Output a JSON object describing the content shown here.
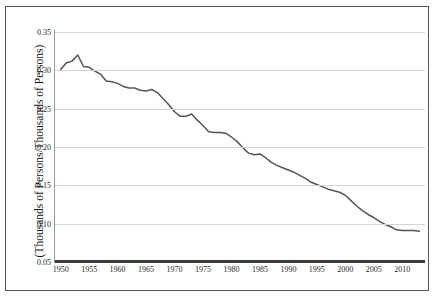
{
  "figure": {
    "clipped_header_text": "",
    "background_color": "#ffffff",
    "border_color": "#555555"
  },
  "axis": {
    "y_title": "(Thousands of Persons/Thousands of Persons)",
    "y_ticks": [
      "0.35",
      "0.30",
      "0.25",
      "0.20",
      "0.15",
      "0.10",
      "0.05"
    ],
    "x_ticks": [
      "1950",
      "1955",
      "1960",
      "1965",
      "1970",
      "1975",
      "1980",
      "1985",
      "1990",
      "1995",
      "2000",
      "2005",
      "2010"
    ]
  },
  "chart_data": {
    "type": "line",
    "title": "",
    "xlabel": "",
    "ylabel": "(Thousands of Persons/Thousands of Persons)",
    "xlim": [
      1949,
      2014
    ],
    "ylim": [
      0.05,
      0.35
    ],
    "grid": true,
    "legend": "none",
    "line_color": "#555555",
    "x": [
      1950,
      1951,
      1952,
      1953,
      1954,
      1955,
      1956,
      1957,
      1958,
      1959,
      1960,
      1961,
      1962,
      1963,
      1964,
      1965,
      1966,
      1967,
      1968,
      1969,
      1970,
      1971,
      1972,
      1973,
      1974,
      1975,
      1976,
      1977,
      1978,
      1979,
      1980,
      1981,
      1982,
      1983,
      1984,
      1985,
      1986,
      1987,
      1988,
      1989,
      1990,
      1991,
      1992,
      1993,
      1994,
      1995,
      1996,
      1997,
      1998,
      1999,
      2000,
      2001,
      2002,
      2003,
      2004,
      2005,
      2006,
      2007,
      2008,
      2009,
      2010,
      2011,
      2012,
      2013
    ],
    "values": [
      0.301,
      0.31,
      0.312,
      0.32,
      0.305,
      0.304,
      0.299,
      0.295,
      0.286,
      0.285,
      0.283,
      0.279,
      0.277,
      0.277,
      0.274,
      0.273,
      0.275,
      0.271,
      0.263,
      0.255,
      0.246,
      0.24,
      0.24,
      0.243,
      0.235,
      0.228,
      0.22,
      0.219,
      0.219,
      0.218,
      0.213,
      0.207,
      0.199,
      0.192,
      0.19,
      0.191,
      0.186,
      0.18,
      0.176,
      0.173,
      0.17,
      0.167,
      0.163,
      0.159,
      0.154,
      0.151,
      0.148,
      0.145,
      0.143,
      0.141,
      0.137,
      0.13,
      0.123,
      0.117,
      0.112,
      0.108,
      0.103,
      0.099,
      0.096,
      0.092,
      0.091,
      0.091,
      0.091,
      0.09
    ],
    "series": [
      {
        "name": "ratio",
        "values": [
          0.301,
          0.31,
          0.312,
          0.32,
          0.305,
          0.304,
          0.299,
          0.295,
          0.286,
          0.285,
          0.283,
          0.279,
          0.277,
          0.277,
          0.274,
          0.273,
          0.275,
          0.271,
          0.263,
          0.255,
          0.246,
          0.24,
          0.24,
          0.243,
          0.235,
          0.228,
          0.22,
          0.219,
          0.219,
          0.218,
          0.213,
          0.207,
          0.199,
          0.192,
          0.19,
          0.191,
          0.186,
          0.18,
          0.176,
          0.173,
          0.17,
          0.167,
          0.163,
          0.159,
          0.154,
          0.151,
          0.148,
          0.145,
          0.143,
          0.141,
          0.137,
          0.13,
          0.123,
          0.117,
          0.112,
          0.108,
          0.103,
          0.099,
          0.096,
          0.092,
          0.091,
          0.091,
          0.091,
          0.09
        ]
      }
    ]
  }
}
